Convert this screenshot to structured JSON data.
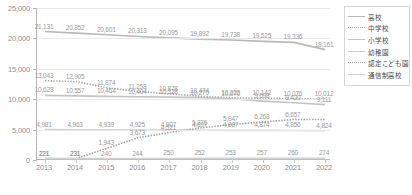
{
  "chart_data": {
    "type": "line",
    "title": "",
    "subtitle": "",
    "xlabel": "",
    "ylabel": "",
    "x": [
      "2013",
      "2014",
      "2015",
      "2016",
      "2017",
      "2018",
      "2019",
      "2020",
      "2021",
      "2022"
    ],
    "ylim": [
      0,
      25000
    ],
    "yticks": [
      0,
      5000,
      10000,
      15000,
      20000,
      25000
    ],
    "ytick_labels": [
      "0",
      "5,000",
      "10,000",
      "15,000",
      "20,000",
      "25,000"
    ],
    "grid": true,
    "legend_position": "right",
    "series": [
      {
        "name": "高校",
        "color": "#b9b9b9",
        "style": "solid",
        "values": [
          21131,
          20852,
          20601,
          20313,
          20095,
          19892,
          19738,
          19525,
          19336,
          18161
        ],
        "labels": [
          "21,131",
          "20,852",
          "20,601",
          "20,313",
          "20,095",
          "19,892",
          "19,738",
          "19,525",
          "19,336",
          "18,161"
        ]
      },
      {
        "name": "中学校",
        "color": "#a8a8a8",
        "style": "dotted",
        "values": [
          13043,
          12905,
          11874,
          11258,
          10878,
          10474,
          10222,
          10142,
          10076,
          10012
        ],
        "labels": [
          "13,043",
          "12,905",
          "11,874",
          "11,258",
          "10,878",
          "10,474",
          "10,222",
          "10,142",
          "10,076",
          "10,012"
        ]
      },
      {
        "name": "小学校",
        "color": "#c4c4c4",
        "style": "solid",
        "values": [
          10628,
          10557,
          10464,
          10404,
          10328,
          10270,
          10070,
          9698,
          9420,
          9111
        ],
        "labels": [
          "10,628",
          "10,557",
          "10,464",
          "10,404",
          "10,328",
          "10,270",
          "10,070",
          "9,698",
          "9,420",
          "9,111"
        ]
      },
      {
        "name": "幼稚園",
        "color": "#cfcfcf",
        "style": "solid",
        "values": [
          4981,
          4963,
          4939,
          4925,
          4907,
          4897,
          4887,
          4874,
          4856,
          4824
        ],
        "labels": [
          "4,981",
          "4,963",
          "4,939",
          "4,925",
          "4,907",
          "4,897",
          "4,887",
          "4,874",
          "4,856",
          "4,824"
        ]
      },
      {
        "name": "認定こども園",
        "color": "#9e9e9e",
        "style": "dotted",
        "values": [
          221,
          231,
          1943,
          3673,
          4521,
          5276,
          5847,
          6268,
          6657,
          6657
        ],
        "labels": [
          "221",
          "231",
          "1,943",
          "3,673",
          "4,521",
          "5,276",
          "5,847",
          "6,268",
          "6,657",
          ""
        ]
      },
      {
        "name": "通信制高校",
        "color": "#d2d2d2",
        "style": "solid",
        "values": [
          221,
          231,
          240,
          244,
          250,
          252,
          253,
          257,
          260,
          274
        ],
        "labels": [
          "221",
          "231",
          "240",
          "244",
          "250",
          "252",
          "253",
          "257",
          "260",
          "274"
        ]
      }
    ]
  },
  "legend": {
    "items": [
      {
        "label": "高校"
      },
      {
        "label": "中学校"
      },
      {
        "label": "小学校"
      },
      {
        "label": "幼稚園"
      },
      {
        "label": "認定こども園"
      },
      {
        "label": "通信制高校"
      }
    ]
  }
}
